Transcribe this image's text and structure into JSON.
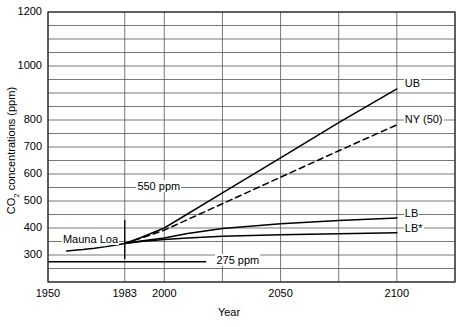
{
  "chart_data": {
    "type": "line",
    "title": "",
    "xlabel": "Year",
    "ylabel": "CO2 concentrations (ppm)",
    "ylabel_parts": {
      "pre": "CO",
      "sub": "2",
      "post": " concentrations (ppm)"
    },
    "xlim": [
      1950,
      2125
    ],
    "ylim": [
      200,
      1200
    ],
    "grid": true,
    "y_gridline_step": 50,
    "y_tick_labels": [
      "1200",
      "1000",
      "800",
      "700",
      "600",
      "500",
      "400",
      "300"
    ],
    "y_tick_values": [
      1200,
      1000,
      800,
      700,
      600,
      500,
      400,
      300
    ],
    "x_tick_labels": [
      "1950",
      "1983",
      "2000",
      "2050",
      "2100"
    ],
    "x_tick_values": [
      1950,
      1983,
      2000,
      2050,
      2100
    ],
    "x_gridline_values": [
      1950,
      1983,
      2000,
      2025,
      2050,
      2075,
      2100,
      2125
    ],
    "legend_position": "inline-right-end-labels",
    "series": [
      {
        "name": "UB",
        "label": "UB",
        "style": "solid",
        "label_x": 2103,
        "label_y": 930,
        "points": [
          [
            1983,
            343
          ],
          [
            1990,
            365
          ],
          [
            2000,
            400
          ],
          [
            2025,
            530
          ],
          [
            2050,
            660
          ],
          [
            2075,
            790
          ],
          [
            2100,
            915
          ]
        ]
      },
      {
        "name": "NY (50)",
        "label": "NY (50)",
        "style": "dashed",
        "label_x": 2103,
        "label_y": 795,
        "points": [
          [
            1983,
            343
          ],
          [
            1990,
            362
          ],
          [
            2000,
            392
          ],
          [
            2025,
            490
          ],
          [
            2050,
            588
          ],
          [
            2075,
            686
          ],
          [
            2100,
            782
          ]
        ]
      },
      {
        "name": "LB",
        "label": "LB",
        "style": "solid",
        "label_x": 2103,
        "label_y": 450,
        "points": [
          [
            1983,
            343
          ],
          [
            1990,
            352
          ],
          [
            2000,
            363
          ],
          [
            2010,
            380
          ],
          [
            2025,
            398
          ],
          [
            2050,
            416
          ],
          [
            2075,
            428
          ],
          [
            2100,
            437
          ]
        ]
      },
      {
        "name": "LB*",
        "label": "LB*",
        "style": "solid",
        "label_x": 2103,
        "label_y": 392,
        "points": [
          [
            1983,
            343
          ],
          [
            1990,
            350
          ],
          [
            2000,
            357
          ],
          [
            2010,
            363
          ],
          [
            2025,
            369
          ],
          [
            2050,
            375
          ],
          [
            2075,
            379
          ],
          [
            2100,
            382
          ]
        ]
      },
      {
        "name": "Mauna Loa",
        "label": "Mauna Loa",
        "style": "solid",
        "label_x": 1956,
        "label_y": 352,
        "points": [
          [
            1958,
            315
          ],
          [
            1965,
            320
          ],
          [
            1970,
            325
          ],
          [
            1975,
            331
          ],
          [
            1980,
            338
          ],
          [
            1983,
            343
          ]
        ]
      }
    ],
    "reference_lines": [
      {
        "name": "275 ppm",
        "label": "275 ppm",
        "value": 275,
        "style": "solid",
        "x_start": 1950,
        "x_end": 2018,
        "label_x": 2022,
        "label_y": 275
      },
      {
        "name": "550 ppm",
        "label": "550 ppm",
        "value": 550,
        "style": "gridline-annotation",
        "label_x": 1988,
        "label_y": 550
      }
    ],
    "markers": [
      {
        "name": "1983-vertical-tick",
        "x": 1983,
        "y_low": 285,
        "y_high": 430
      }
    ]
  }
}
